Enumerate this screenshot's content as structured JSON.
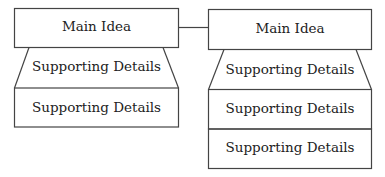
{
  "diagram": {
    "left": {
      "main": "Main Idea",
      "details": [
        "Supporting Details",
        "Supporting Details"
      ]
    },
    "right": {
      "main": "Main Idea",
      "details": [
        "Supporting Details",
        "Supporting Details",
        "Supporting Details"
      ]
    },
    "colors": {
      "stroke": "#444444",
      "text": "#222222",
      "background": "#ffffff"
    }
  }
}
